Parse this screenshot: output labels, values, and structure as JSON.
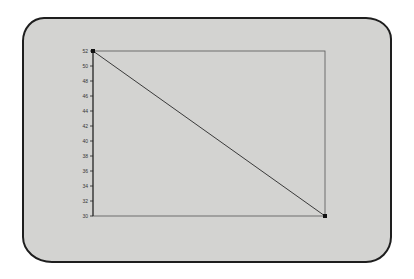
{
  "chart_data": {
    "type": "line",
    "title": "",
    "xlabel": "",
    "ylabel": "",
    "ylim": [
      30,
      52
    ],
    "yticks": [
      52,
      50,
      48,
      46,
      44,
      42,
      40,
      38,
      36,
      34,
      32,
      30
    ],
    "x": [
      0,
      1
    ],
    "series": [
      {
        "name": "series-1",
        "values": [
          52,
          30
        ],
        "color": "#3a3a3a",
        "markers": "square"
      }
    ],
    "grid": false,
    "frame": true,
    "legend": null
  },
  "colors": {
    "screen_bg": "#d3d3d1",
    "bezel": "#1e1e1e",
    "line": "#3a3a3a",
    "page_bg": "#ffffff"
  }
}
